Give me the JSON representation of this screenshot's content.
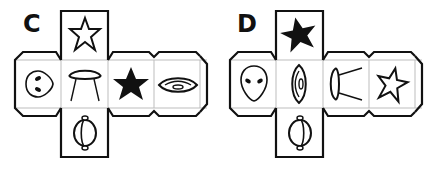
{
  "colors": {
    "stroke": "#111111",
    "inner_line": "#bdbdbd",
    "background": "#ffffff"
  },
  "nets": [
    {
      "label": "C",
      "faces": {
        "top": "star-outline",
        "left": "alien-head-sideways",
        "center": "ufo-with-beam",
        "right1": "star-filled",
        "right2": "eye-spaceship",
        "bottom": "planet-ringed"
      }
    },
    {
      "label": "D",
      "faces": {
        "top": "star-filled",
        "left": "alien-head",
        "center": "eye-spaceship-vertical",
        "right1": "ufo-with-beam-sideways",
        "right2": "star-outline",
        "bottom": "planet-ringed"
      }
    }
  ]
}
